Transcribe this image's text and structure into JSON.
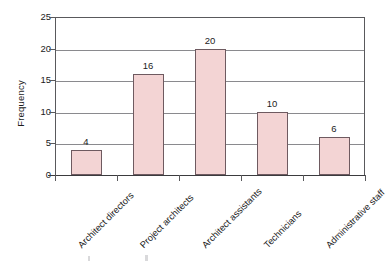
{
  "chart_data": {
    "type": "bar",
    "title": "",
    "subtitle": "",
    "xlabel": "",
    "ylabel": "Frequency",
    "categories": [
      "Architect directors",
      "Project architects",
      "Architect assistants",
      "Technicians",
      "Administrative staff"
    ],
    "values": [
      4,
      16,
      20,
      10,
      6
    ],
    "data_labels": [
      "4",
      "16",
      "20",
      "10",
      "6"
    ],
    "ylim": [
      0,
      25
    ],
    "y_ticks": [
      0,
      5,
      10,
      15,
      20,
      25
    ],
    "y_tick_labels": [
      "0",
      "5",
      "10",
      "15",
      "20",
      "25"
    ],
    "grid": "horizontal",
    "legend": "none",
    "bar_fill_color": "#f3d4d4",
    "bar_border_color": "#6e5a60",
    "gridline_color": "#8a8a8e",
    "axis_color": "#59595c",
    "background_color": "#ffffff",
    "x_tick_label_rotation": -45
  }
}
